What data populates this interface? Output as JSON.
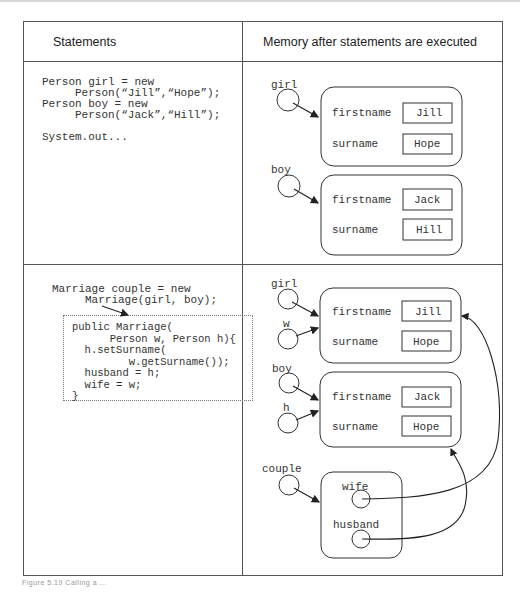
{
  "table": {
    "headers": {
      "statements": "Statements",
      "memory": "Memory after statements are executed"
    },
    "rows": [
      {
        "statements": [
          "Person girl = new",
          "     Person(“Jill”,“Hope”);",
          "Person boy = new",
          "     Person(“Jack”,“Hill”);",
          "",
          "System.out..."
        ],
        "memory": {
          "variables": [
            {
              "name": "girl"
            },
            {
              "name": "boy"
            }
          ],
          "objects": [
            {
              "fields": [
                {
                  "name": "firstname",
                  "value": "Jill"
                },
                {
                  "name": "surname",
                  "value": "Hope"
                }
              ]
            },
            {
              "fields": [
                {
                  "name": "firstname",
                  "value": "Jack"
                },
                {
                  "name": "surname",
                  "value": "Hill"
                }
              ]
            }
          ]
        }
      },
      {
        "statements": [
          "Marriage couple = new",
          "     Marriage(girl, boy);"
        ],
        "constructor": [
          "public Marriage(",
          "      Person w, Person h){",
          "  h.setSurname(",
          "         w.getSurname());",
          "  husband = h;",
          "  wife = w;",
          "}"
        ],
        "memory": {
          "variables": [
            {
              "name": "girl"
            },
            {
              "name": "w"
            },
            {
              "name": "boy"
            },
            {
              "name": "h"
            },
            {
              "name": "couple"
            }
          ],
          "objects": [
            {
              "fields": [
                {
                  "name": "firstname",
                  "value": "Jill"
                },
                {
                  "name": "surname",
                  "value": "Hope"
                }
              ]
            },
            {
              "fields": [
                {
                  "name": "firstname",
                  "value": "Jack"
                },
                {
                  "name": "surname",
                  "value": "Hope"
                }
              ]
            },
            {
              "fields": [
                {
                  "name": "wife"
                },
                {
                  "name": "husband"
                }
              ]
            }
          ]
        }
      }
    ]
  },
  "caption": "Figure 5.19 Calling a ..."
}
